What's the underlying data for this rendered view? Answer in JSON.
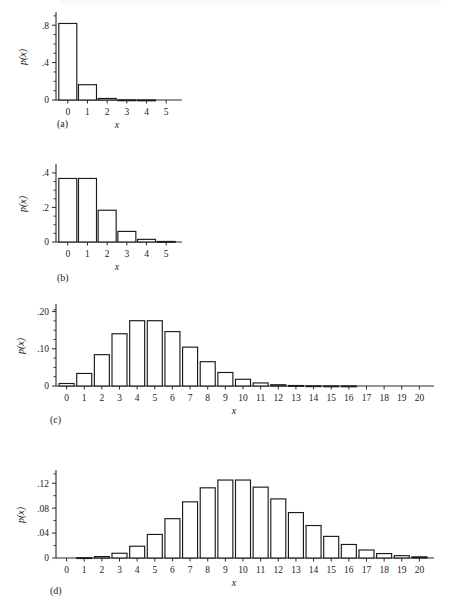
{
  "figure": {
    "title": "",
    "panel_captions": [
      "(a)",
      "(b)",
      "(c)",
      "(d)"
    ],
    "axis_label_y": "p(x)",
    "axis_label_x": "x"
  },
  "chart_data": [
    {
      "type": "bar",
      "panel": "(a)",
      "title": "",
      "xlabel": "x",
      "ylabel": "p(x)",
      "categories": [
        "0",
        "1",
        "2",
        "3",
        "4",
        "5"
      ],
      "x": [
        0,
        1,
        2,
        3,
        4,
        5
      ],
      "values": [
        0.8187,
        0.1637,
        0.0164,
        0.0011,
        0.0001,
        0.0
      ],
      "xlim": [
        -0.6,
        5.6
      ],
      "ylim": [
        0,
        0.92
      ],
      "ytick_labels": [
        "0",
        ".4",
        ".8"
      ],
      "ytick_values": [
        0,
        0.4,
        0.8
      ],
      "yminor_values": [
        0.1,
        0.2,
        0.3,
        0.5,
        0.6,
        0.7,
        0.9
      ],
      "xtick_labels": [
        "0",
        "1",
        "2",
        "3",
        "4",
        "5"
      ],
      "grid": false,
      "legend": "none"
    },
    {
      "type": "bar",
      "panel": "(b)",
      "title": "",
      "xlabel": "x",
      "ylabel": "p(x)",
      "categories": [
        "0",
        "1",
        "2",
        "3",
        "4",
        "5"
      ],
      "x": [
        0,
        1,
        2,
        3,
        4,
        5
      ],
      "values": [
        0.3679,
        0.3679,
        0.1839,
        0.0613,
        0.0153,
        0.0031
      ],
      "xlim": [
        -0.6,
        5.6
      ],
      "ylim": [
        0,
        0.44
      ],
      "ytick_labels": [
        "0",
        ".2",
        ".4"
      ],
      "ytick_values": [
        0,
        0.2,
        0.4
      ],
      "yminor_values": [
        0.05,
        0.1,
        0.15,
        0.25,
        0.3,
        0.35
      ],
      "xtick_labels": [
        "0",
        "1",
        "2",
        "3",
        "4",
        "5"
      ],
      "grid": false,
      "legend": "none"
    },
    {
      "type": "bar",
      "panel": "(c)",
      "title": "",
      "xlabel": "x",
      "ylabel": "p(x)",
      "categories": [
        "0",
        "1",
        "2",
        "3",
        "4",
        "5",
        "6",
        "7",
        "8",
        "9",
        "10",
        "11",
        "12",
        "13",
        "14",
        "15",
        "16",
        "17",
        "18",
        "19",
        "20"
      ],
      "x": [
        0,
        1,
        2,
        3,
        4,
        5,
        6,
        7,
        8,
        9,
        10,
        11,
        12,
        13,
        14,
        15,
        16,
        17,
        18,
        19,
        20
      ],
      "values": [
        0.0067,
        0.0337,
        0.0842,
        0.1404,
        0.1755,
        0.1755,
        0.1462,
        0.1044,
        0.0653,
        0.0363,
        0.0181,
        0.0082,
        0.0034,
        0.0013,
        0.0005,
        0.0002,
        0.0001,
        0.0,
        0.0,
        0.0,
        0.0
      ],
      "xlim": [
        -0.6,
        20.6
      ],
      "ylim": [
        0,
        0.215
      ],
      "ytick_labels": [
        "0",
        ".10",
        ".20"
      ],
      "ytick_values": [
        0,
        0.1,
        0.2
      ],
      "yminor_values": [
        0.025,
        0.05,
        0.075,
        0.125,
        0.15,
        0.175,
        0.205
      ],
      "xtick_labels": [
        "0",
        "1",
        "2",
        "3",
        "4",
        "5",
        "6",
        "7",
        "8",
        "9",
        "10",
        "11",
        "12",
        "13",
        "14",
        "15",
        "16",
        "17",
        "18",
        "19",
        "20"
      ],
      "grid": false,
      "legend": "none"
    },
    {
      "type": "bar",
      "panel": "(d)",
      "title": "",
      "xlabel": "x",
      "ylabel": "p(x)",
      "categories": [
        "0",
        "1",
        "2",
        "3",
        "4",
        "5",
        "6",
        "7",
        "8",
        "9",
        "10",
        "11",
        "12",
        "13",
        "14",
        "15",
        "16",
        "17",
        "18",
        "19",
        "20"
      ],
      "x": [
        0,
        1,
        2,
        3,
        4,
        5,
        6,
        7,
        8,
        9,
        10,
        11,
        12,
        13,
        14,
        15,
        16,
        17,
        18,
        19,
        20
      ],
      "values": [
        0.0,
        0.0005,
        0.0023,
        0.0076,
        0.0189,
        0.0378,
        0.0631,
        0.0901,
        0.1126,
        0.1251,
        0.1251,
        0.1137,
        0.0948,
        0.0729,
        0.0521,
        0.0347,
        0.0217,
        0.0128,
        0.0071,
        0.0037,
        0.0019
      ],
      "xlim": [
        -0.6,
        20.6
      ],
      "ylim": [
        0,
        0.138
      ],
      "ytick_labels": [
        "0",
        ".04",
        ".08",
        ".12"
      ],
      "ytick_values": [
        0,
        0.04,
        0.08,
        0.12
      ],
      "yminor_values": [
        0.02,
        0.06,
        0.1,
        0.135
      ],
      "xtick_labels": [
        "0",
        "1",
        "2",
        "3",
        "4",
        "5",
        "6",
        "7",
        "8",
        "9",
        "10",
        "11",
        "12",
        "13",
        "14",
        "15",
        "16",
        "17",
        "18",
        "19",
        "20"
      ],
      "grid": false,
      "legend": "none"
    }
  ],
  "panels": [
    {
      "caption": "(a)",
      "caption_left": 57,
      "caption_top": 118
    },
    {
      "caption": "(b)",
      "caption_left": 57,
      "caption_top": 272
    },
    {
      "caption": "(c)",
      "caption_left": 50,
      "caption_top": 414
    },
    {
      "caption": "(d)",
      "caption_left": 50,
      "caption_top": 585
    }
  ]
}
